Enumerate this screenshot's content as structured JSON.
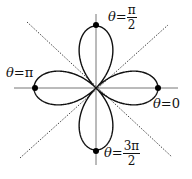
{
  "diagram": {
    "type": "polar-rose",
    "curve": "r = cos(2θ)",
    "petals": 4,
    "center": [
      96,
      88
    ],
    "radius_px": 62,
    "colors": {
      "curve": "#111111",
      "axis": "#777777",
      "dotted": "#444444",
      "point": "#000000"
    },
    "axes": {
      "horizontal": {
        "x1": 14,
        "y1": 88,
        "x2": 178,
        "y2": 88
      },
      "vertical": {
        "x1": 96,
        "y1": 14,
        "x2": 96,
        "y2": 165
      }
    },
    "dotted_lines": [
      {
        "x1": 27,
        "y1": 22,
        "x2": 172,
        "y2": 157
      },
      {
        "x1": 20,
        "y1": 158,
        "x2": 168,
        "y2": 25
      }
    ],
    "points": [
      {
        "name": "theta-pi-over-2",
        "x": 96,
        "y": 25
      },
      {
        "name": "theta-pi",
        "x": 35,
        "y": 88
      },
      {
        "name": "theta-0",
        "x": 158,
        "y": 88
      },
      {
        "name": "theta-3pi-over-2",
        "x": 96,
        "y": 151
      }
    ],
    "labels": {
      "top": {
        "theta": "θ",
        "eq": "=",
        "num": "π",
        "den": "2"
      },
      "left": {
        "theta": "θ",
        "eq": "=",
        "value": "π"
      },
      "right": {
        "theta": "θ",
        "eq": "=",
        "value": "0"
      },
      "bottom": {
        "theta": "θ",
        "eq": "=",
        "num": "3π",
        "den": "2"
      }
    }
  }
}
